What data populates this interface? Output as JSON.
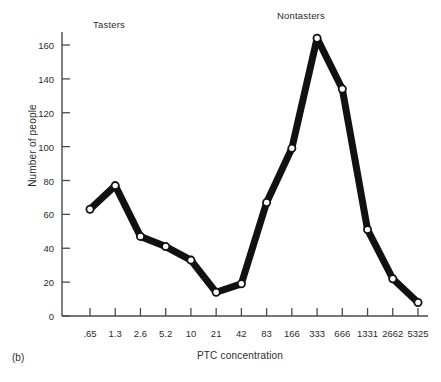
{
  "caption": "(b)",
  "annotations": [
    {
      "name": "tasters",
      "text": "Tasters"
    },
    {
      "name": "nontasters",
      "text": "Nontasters"
    }
  ],
  "colors": {
    "line": "#111111",
    "axis": "#4a4a4a",
    "marker_fill": "#ffffff",
    "text": "#2b2b2b",
    "background": "#ffffff"
  },
  "chart_data": {
    "type": "line",
    "title": "",
    "subtitle": "",
    "xlabel": "PTC concentration",
    "ylabel": "Number of people",
    "categories": [
      ".65",
      "1.3",
      "2.6",
      "5.2",
      "10",
      "21",
      "42",
      "83",
      "166",
      "333",
      "666",
      "1331",
      "2662",
      "5325"
    ],
    "values": [
      63,
      77,
      47,
      41,
      33,
      14,
      19,
      67,
      99,
      164,
      134,
      51,
      22,
      8
    ],
    "series": [
      {
        "name": "Number of people",
        "values": [
          63,
          77,
          47,
          41,
          33,
          14,
          19,
          67,
          99,
          164,
          134,
          51,
          22,
          8
        ]
      }
    ],
    "ylim": [
      0,
      170
    ],
    "yticks": [
      0,
      20,
      40,
      60,
      80,
      100,
      120,
      140,
      160
    ],
    "ytick_labels": [
      "0",
      "20",
      "40",
      "60",
      "80",
      "100",
      "120",
      "140",
      "160"
    ],
    "grid": false,
    "legend": "none",
    "markers": "open-circle",
    "annotations": [
      {
        "text": "Tasters",
        "region_categories": [
          ".65",
          "1.3",
          "2.6",
          "5.2",
          "10",
          "21"
        ]
      },
      {
        "text": "Nontasters",
        "region_categories": [
          "83",
          "166",
          "333",
          "666",
          "1331",
          "2662",
          "5325"
        ]
      }
    ]
  }
}
